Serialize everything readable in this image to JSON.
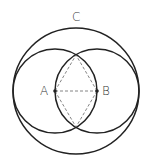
{
  "diagram": {
    "labels": {
      "A": "A",
      "B": "B",
      "C": "C"
    },
    "points": {
      "A": {
        "x": 55,
        "y": 91
      },
      "B": {
        "x": 97,
        "y": 91
      },
      "top_intersection": {
        "x": 76,
        "y": 55
      },
      "bottom_intersection": {
        "x": 76,
        "y": 127
      }
    },
    "circles": {
      "circle_A": {
        "cx": 55,
        "cy": 91,
        "r": 42
      },
      "circle_B": {
        "cx": 97,
        "cy": 91,
        "r": 42
      },
      "circle_C": {
        "cx": 76,
        "cy": 91,
        "r": 63
      }
    },
    "colors": {
      "stroke": "#222222",
      "dashed": "#666666",
      "label": "#333333",
      "background": "#ffffff"
    }
  }
}
